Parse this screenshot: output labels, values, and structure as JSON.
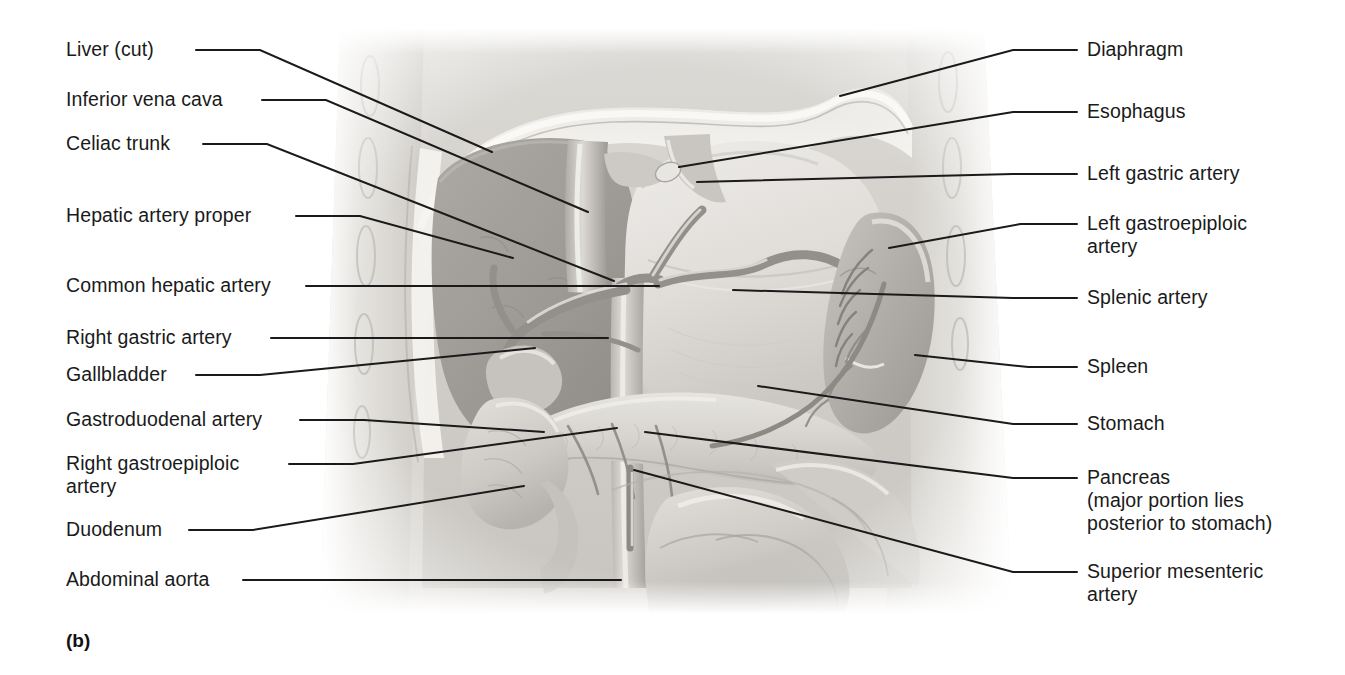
{
  "figure": {
    "caption": "(b)",
    "kind": "anatomical-illustration",
    "background_color": "#ffffff",
    "line_color": "#1a1a1a",
    "art_palette": {
      "body_wall_light": "#d8d5d0",
      "body_wall_mid": "#c3c0bb",
      "liver_dark": "#9d9a96",
      "stomach_light": "#e2e0dc",
      "pancreas": "#d0cdc8",
      "spleen": "#b5b2ad",
      "intestine": "#cecbc6",
      "vessel_dark": "#8b8884",
      "highlight": "#f2f1ee"
    }
  },
  "labels_left": [
    {
      "id": "liver-cut",
      "text": "Liver (cut)",
      "x": 66,
      "y": 38,
      "anchor_x": 196,
      "anchor_y": 50,
      "target_x": 492,
      "target_y": 152
    },
    {
      "id": "inferior-vena-cava",
      "text": "Inferior vena cava",
      "x": 66,
      "y": 88,
      "anchor_x": 262,
      "anchor_y": 100,
      "target_x": 588,
      "target_y": 212
    },
    {
      "id": "celiac-trunk",
      "text": "Celiac trunk",
      "x": 66,
      "y": 132,
      "anchor_x": 203,
      "anchor_y": 144,
      "target_x": 614,
      "target_y": 281
    },
    {
      "id": "hepatic-artery-proper",
      "text": "Hepatic artery proper",
      "x": 66,
      "y": 204,
      "anchor_x": 296,
      "anchor_y": 216,
      "target_x": 513,
      "target_y": 258
    },
    {
      "id": "common-hepatic-artery",
      "text": "Common hepatic artery",
      "x": 66,
      "y": 274,
      "anchor_x": 306,
      "anchor_y": 286,
      "target_x": 659,
      "target_y": 286
    },
    {
      "id": "right-gastric-artery",
      "text": "Right gastric artery",
      "x": 66,
      "y": 326,
      "anchor_x": 271,
      "anchor_y": 338,
      "target_x": 608,
      "target_y": 338
    },
    {
      "id": "gallbladder",
      "text": "Gallbladder",
      "x": 66,
      "y": 363,
      "anchor_x": 196,
      "anchor_y": 375,
      "target_x": 535,
      "target_y": 348
    },
    {
      "id": "gastroduodenal-artery",
      "text": "Gastroduodenal artery",
      "x": 66,
      "y": 408,
      "anchor_x": 300,
      "anchor_y": 420,
      "target_x": 544,
      "target_y": 432
    },
    {
      "id": "right-gastroepiploic-artery",
      "text": "Right gastroepiploic\nartery",
      "x": 66,
      "y": 452,
      "anchor_x": 289,
      "anchor_y": 464,
      "target_x": 617,
      "target_y": 428
    },
    {
      "id": "duodenum",
      "text": "Duodenum",
      "x": 66,
      "y": 518,
      "anchor_x": 189,
      "anchor_y": 530,
      "target_x": 524,
      "target_y": 486
    },
    {
      "id": "abdominal-aorta",
      "text": "Abdominal aorta",
      "x": 66,
      "y": 568,
      "anchor_x": 243,
      "anchor_y": 580,
      "target_x": 621,
      "target_y": 580
    }
  ],
  "labels_right": [
    {
      "id": "diaphragm",
      "text": "Diaphragm",
      "x": 1087,
      "y": 38,
      "anchor_x": 1077,
      "anchor_y": 50,
      "target_x": 840,
      "target_y": 96
    },
    {
      "id": "esophagus",
      "text": "Esophagus",
      "x": 1087,
      "y": 100,
      "anchor_x": 1077,
      "anchor_y": 112,
      "target_x": 679,
      "target_y": 167
    },
    {
      "id": "left-gastric-artery",
      "text": "Left gastric artery",
      "x": 1087,
      "y": 162,
      "anchor_x": 1077,
      "anchor_y": 174,
      "target_x": 697,
      "target_y": 182
    },
    {
      "id": "left-gastroepiploic-artery",
      "text": "Left gastroepiploic\nartery",
      "x": 1087,
      "y": 212,
      "anchor_x": 1077,
      "anchor_y": 224,
      "target_x": 889,
      "target_y": 248
    },
    {
      "id": "splenic-artery",
      "text": "Splenic artery",
      "x": 1087,
      "y": 286,
      "anchor_x": 1077,
      "anchor_y": 298,
      "target_x": 733,
      "target_y": 290
    },
    {
      "id": "spleen",
      "text": "Spleen",
      "x": 1087,
      "y": 355,
      "anchor_x": 1077,
      "anchor_y": 367,
      "target_x": 915,
      "target_y": 355
    },
    {
      "id": "stomach",
      "text": "Stomach",
      "x": 1087,
      "y": 412,
      "anchor_x": 1077,
      "anchor_y": 424,
      "target_x": 758,
      "target_y": 386
    },
    {
      "id": "pancreas",
      "text": "Pancreas\n(major portion lies\nposterior to stomach)",
      "x": 1087,
      "y": 466,
      "anchor_x": 1077,
      "anchor_y": 478,
      "target_x": 645,
      "target_y": 432
    },
    {
      "id": "superior-mesenteric-artery",
      "text": "Superior mesenteric\nartery",
      "x": 1087,
      "y": 560,
      "anchor_x": 1077,
      "anchor_y": 572,
      "target_x": 634,
      "target_y": 470
    }
  ]
}
